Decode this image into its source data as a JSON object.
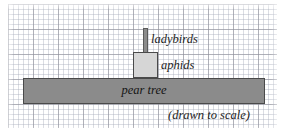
{
  "figure": {
    "type": "ecological-pyramid-diagram",
    "background_color": "#ffffff",
    "grid": {
      "name": "graph-paper",
      "minor_spacing_px": 5,
      "major_spacing_px": 25,
      "minor_color": "#a5aab9",
      "major_color": "#8c8c96"
    },
    "caption": "(drawn to scale)"
  },
  "bars": [
    {
      "key": "ladybirds",
      "label": "ladybirds",
      "fill_color": "#8b8b8b",
      "border_color": "#5a5a5a",
      "label_position": "right"
    },
    {
      "key": "aphids",
      "label": "aphids",
      "fill_color": "#d6d6d6",
      "border_color": "#4a4a4a",
      "label_position": "right"
    },
    {
      "key": "pear_tree",
      "label": "pear tree",
      "fill_color": "#8b8b8b",
      "border_color": "#4a4a4a",
      "label_position": "inside-center"
    }
  ],
  "chart_data": {
    "type": "bar",
    "title": "",
    "subtitle": "",
    "annotations": [
      "(drawn to scale)"
    ],
    "orientation": "horizontal-stacked-pyramid",
    "xlabel": "",
    "ylabel": "",
    "grid": true,
    "legend": "none",
    "units": "grid squares (1 square = 5 px)",
    "categories": [
      "pear tree",
      "aphids",
      "ladybirds"
    ],
    "series": [
      {
        "name": "relative width (grid squares)",
        "values": [
          48.4,
          5.0,
          1.0
        ]
      },
      {
        "name": "relative width (px)",
        "values": [
          242,
          25,
          5
        ]
      }
    ],
    "bars": [
      {
        "category": "pear tree",
        "x_left_px": 23,
        "y_top_px": 78,
        "width_px": 242,
        "height_px": 26
      },
      {
        "category": "aphids",
        "x_left_px": 133,
        "y_top_px": 52,
        "width_px": 25,
        "height_px": 26
      },
      {
        "category": "ladybirds",
        "x_left_px": 143,
        "y_top_px": 28,
        "width_px": 5,
        "height_px": 25
      }
    ]
  }
}
